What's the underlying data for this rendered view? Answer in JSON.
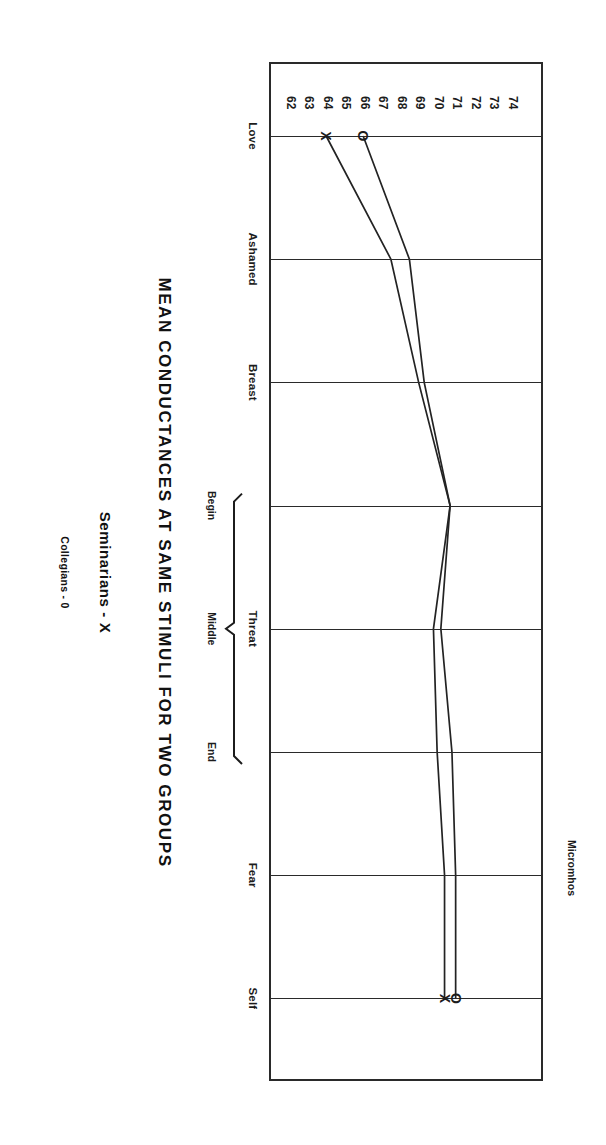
{
  "figure": {
    "title": "MEAN CONDUCTANCES AT SAME STIMULI FOR TWO GROUPS",
    "axis_title": "Micromhos"
  },
  "legend": {
    "entries": [
      {
        "label": "Seminarians - X",
        "marker": "X"
      },
      {
        "label": "Collegians - 0",
        "marker": "0"
      }
    ]
  },
  "brackets": {
    "parent": "Threat",
    "sub_labels": [
      "Begin",
      "Middle",
      "End"
    ]
  },
  "chart_data": {
    "type": "line",
    "title": "MEAN CONDUCTANCES AT SAME STIMULI FOR TWO GROUPS",
    "xlabel": "",
    "ylabel": "Micromhos",
    "orientation": "rotated-90-clockwise",
    "grid": true,
    "legend_position": "below",
    "categories": [
      "Love",
      "Ashamed",
      "Breast",
      "Begin",
      "Middle",
      "End",
      "Fear",
      "Self"
    ],
    "category_groups": [
      {
        "label": "Threat",
        "members": [
          "Begin",
          "Middle",
          "End"
        ]
      }
    ],
    "ylim": [
      62,
      74
    ],
    "yticks": [
      74,
      73,
      72,
      71,
      70,
      69,
      68,
      67,
      66,
      65,
      64,
      63,
      62
    ],
    "series": [
      {
        "name": "Collegians - 0",
        "marker": "0",
        "values": [
          65.9,
          68.4,
          69.2,
          70.6,
          70.1,
          70.7,
          70.9,
          70.9
        ]
      },
      {
        "name": "Seminarians - X",
        "marker": "X",
        "values": [
          63.9,
          67.4,
          68.9,
          70.6,
          69.7,
          69.9,
          70.3,
          70.3
        ]
      }
    ]
  }
}
